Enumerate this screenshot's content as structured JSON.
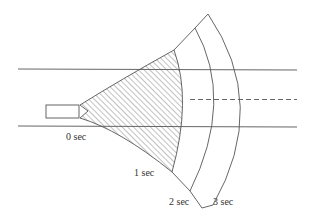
{
  "diagram": {
    "type": "expanding-spray-fan",
    "labels": {
      "t0": "0 sec",
      "t1": "1 sec",
      "t2": "2 sec",
      "t3": "3 sec"
    },
    "colors": {
      "line": "#555555",
      "hatch": "#666666",
      "background": "#ffffff"
    },
    "elements": {
      "boundary_lines": 2,
      "centerline": "dashed",
      "nozzle": "rectangle",
      "shaded_region": "hatched area up to 1 sec"
    }
  }
}
